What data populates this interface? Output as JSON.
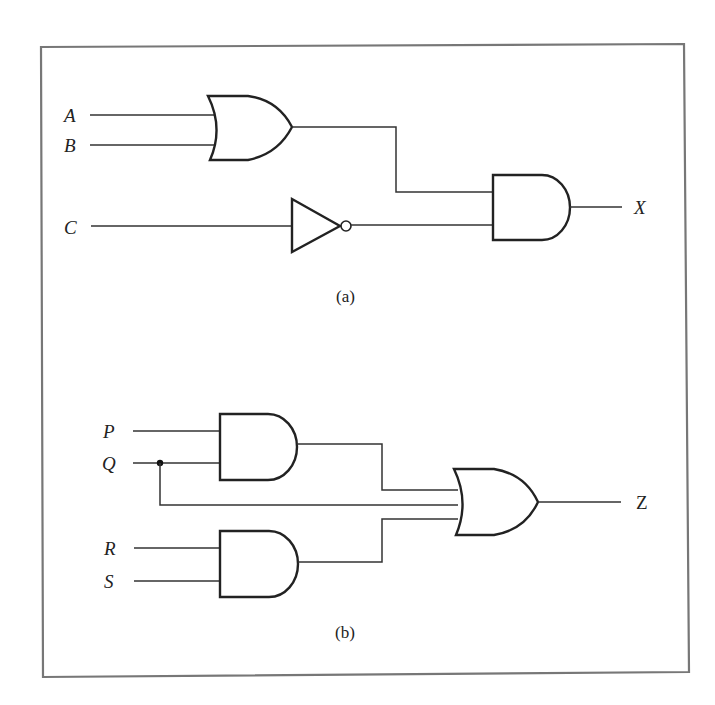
{
  "circuit_a": {
    "inputs": [
      "A",
      "B",
      "C"
    ],
    "output": "X",
    "caption": "(a)",
    "gates": [
      "OR(A,B)",
      "NOT(C)",
      "AND(OR, NOT)"
    ]
  },
  "circuit_b": {
    "inputs": [
      "P",
      "Q",
      "R",
      "S"
    ],
    "output": "Z",
    "caption": "(b)",
    "gates": [
      "AND(P,Q)",
      "AND(R,S)",
      "OR(AND1, Q, AND2)"
    ]
  },
  "colors": {
    "line": "#222222",
    "frame": "#777777",
    "background": "#ffffff"
  }
}
